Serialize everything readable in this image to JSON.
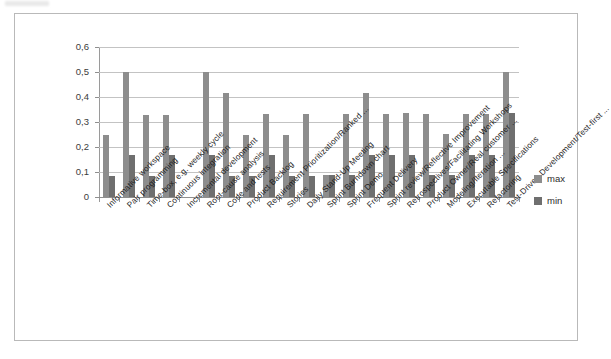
{
  "chart_data": {
    "type": "bar",
    "title": "",
    "xlabel": "",
    "ylabel": "",
    "ylim": [
      0,
      0.6
    ],
    "ytick_labels": [
      "0,6",
      "0,5",
      "0,4",
      "0,3",
      "0,2",
      "0,1",
      "0"
    ],
    "ytick_values": [
      0.6,
      0.5,
      0.4,
      0.3,
      0.2,
      0.1,
      0
    ],
    "grid": true,
    "legend_position": "right",
    "decimal_separator": ",",
    "categories": [
      "Informative workspace",
      "Pair programming",
      "Time-box, e.g. weekly cycle",
      "Continuous integration",
      "Incremental development",
      "Root-cause analysis",
      "Code and tests",
      "Product Backlog",
      "Requirement Prioritization/Ranked ...",
      "Stories",
      "Daily Stand-Up Meeting",
      "Sprint Burndown chart",
      "Sprint Demo",
      "Frequent Delivery",
      "Sprint review/Reflective Improvement",
      "Retrospectives/Facilitating Workshops",
      "Product Owner/Real customer ...",
      "Modeling/Iteration ...",
      "Executable Specifications",
      "Refactoring",
      "Test-Driven Development/Test-first ..."
    ],
    "series": [
      {
        "name": "max",
        "color": "#8d8d8d",
        "values": [
          0.25,
          0.5,
          0.33,
          0.33,
          0,
          0.5,
          0.415,
          0.25,
          0.333,
          0.25,
          0.333,
          0.09,
          0.333,
          0.415,
          0.333,
          0.335,
          0.333,
          0.253,
          0.333,
          0.333,
          0.5
        ]
      },
      {
        "name": "min",
        "color": "#6f6f6f",
        "values": [
          0.083,
          0.167,
          0.084,
          0.167,
          0,
          0.168,
          0.085,
          0.085,
          0.168,
          0.085,
          0.085,
          0.088,
          0.088,
          0.168,
          0.168,
          0.168,
          0.088,
          0.088,
          0.168,
          0.17,
          0.335
        ]
      }
    ]
  },
  "legend": {
    "items": [
      {
        "label": "max",
        "color": "#8d8d8d"
      },
      {
        "label": "min",
        "color": "#6f6f6f"
      }
    ]
  }
}
